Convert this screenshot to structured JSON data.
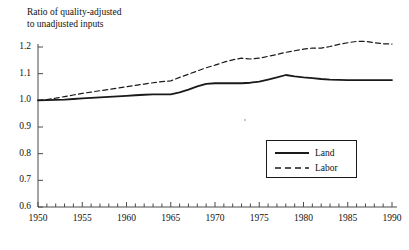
{
  "chart_data": {
    "type": "line",
    "title": "Ratio of quality-adjusted to unadjusted inputs",
    "title_line1": "Ratio of quality-adjusted",
    "title_line2": "to unadjusted inputs",
    "xlabel": "",
    "ylabel": "Ratio of quality-adjusted to unadjusted inputs",
    "xlim": [
      1950,
      1990
    ],
    "ylim": [
      0.6,
      1.2
    ],
    "grid": false,
    "legend_position": "center-right",
    "ytick_labels": [
      "1.2",
      "1.1",
      "1.0",
      "0.9",
      "0.8",
      "0.7",
      "0.6"
    ],
    "ytick_values": [
      1.2,
      1.1,
      1.0,
      0.9,
      0.8,
      0.7,
      0.6
    ],
    "xtick_labels": [
      "1950",
      "1955",
      "1960",
      "1965",
      "1970",
      "1975",
      "1980",
      "1985",
      "1990"
    ],
    "xtick_values": [
      1950,
      1955,
      1960,
      1965,
      1970,
      1975,
      1980,
      1985,
      1990
    ],
    "xminor_step": 1,
    "x": [
      1950,
      1951,
      1952,
      1953,
      1954,
      1955,
      1956,
      1957,
      1958,
      1959,
      1960,
      1961,
      1962,
      1963,
      1964,
      1965,
      1966,
      1967,
      1968,
      1969,
      1970,
      1971,
      1972,
      1973,
      1974,
      1975,
      1976,
      1977,
      1978,
      1979,
      1980,
      1981,
      1982,
      1983,
      1984,
      1985,
      1986,
      1987,
      1988,
      1989,
      1990
    ],
    "series": [
      {
        "name": "Land",
        "style": "solid",
        "color": "#1a1a1a",
        "values": [
          1.0,
          1.001,
          1.002,
          1.003,
          1.005,
          1.007,
          1.009,
          1.011,
          1.013,
          1.015,
          1.017,
          1.019,
          1.021,
          1.022,
          1.022,
          1.022,
          1.03,
          1.04,
          1.052,
          1.062,
          1.064,
          1.064,
          1.064,
          1.064,
          1.066,
          1.07,
          1.078,
          1.086,
          1.095,
          1.09,
          1.086,
          1.083,
          1.08,
          1.078,
          1.077,
          1.076,
          1.076,
          1.076,
          1.076,
          1.076,
          1.076
        ]
      },
      {
        "name": "Labor",
        "style": "dashed",
        "color": "#1a1a1a",
        "values": [
          1.0,
          1.003,
          1.008,
          1.014,
          1.02,
          1.026,
          1.031,
          1.036,
          1.041,
          1.046,
          1.051,
          1.056,
          1.061,
          1.066,
          1.07,
          1.073,
          1.086,
          1.098,
          1.11,
          1.122,
          1.132,
          1.143,
          1.152,
          1.158,
          1.155,
          1.158,
          1.165,
          1.172,
          1.18,
          1.186,
          1.192,
          1.196,
          1.196,
          1.202,
          1.21,
          1.216,
          1.221,
          1.221,
          1.216,
          1.212,
          1.211
        ]
      }
    ],
    "legend": [
      {
        "label": "Land",
        "style": "solid"
      },
      {
        "label": "Labor",
        "style": "dashed"
      }
    ]
  }
}
